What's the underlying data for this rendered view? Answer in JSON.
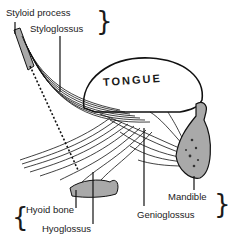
{
  "diagram": {
    "organ_label": "TONGUE",
    "labels": {
      "styloid_process": "Styloid process",
      "styloglossus": "Styloglossus",
      "hyoid_bone": "Hyoid bone",
      "hyoglossus": "Hyoglossus",
      "genioglossus": "Genioglossus",
      "mandible": "Mandible"
    },
    "colors": {
      "line": "#111111",
      "bone_fill": "#a9a9a9",
      "background": "#ffffff"
    }
  }
}
